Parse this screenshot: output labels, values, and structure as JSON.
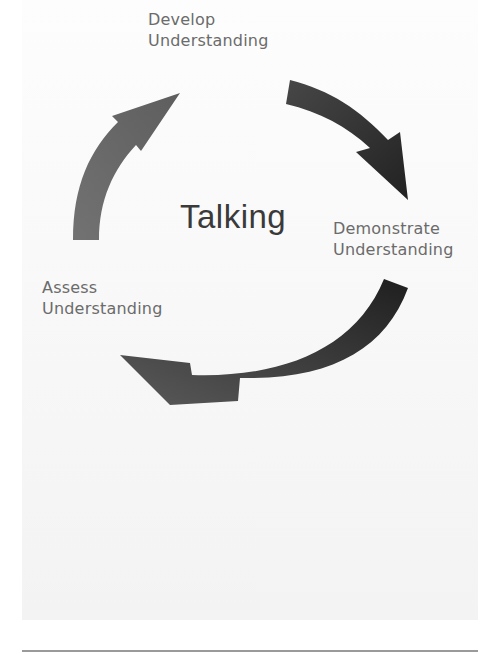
{
  "diagram": {
    "type": "cycle",
    "center_label": "Talking",
    "stages": [
      {
        "id": "develop",
        "line1": "Develop",
        "line2": "Understanding"
      },
      {
        "id": "demonstrate",
        "line1": "Demonstrate",
        "line2": "Understanding"
      },
      {
        "id": "assess",
        "line1": "Assess",
        "line2": "Understanding"
      }
    ],
    "arrows": [
      {
        "from": "assess",
        "to": "develop",
        "color": "#6a6a6a"
      },
      {
        "from": "develop",
        "to": "demonstrate",
        "color": "#2e2e2e"
      },
      {
        "from": "demonstrate",
        "to": "assess",
        "color": "#333333"
      }
    ],
    "colors": {
      "label": "#6b6b6b",
      "center": "#3a3a3a",
      "background": "#f7f7f7",
      "rule": "#9a9a9a"
    }
  }
}
